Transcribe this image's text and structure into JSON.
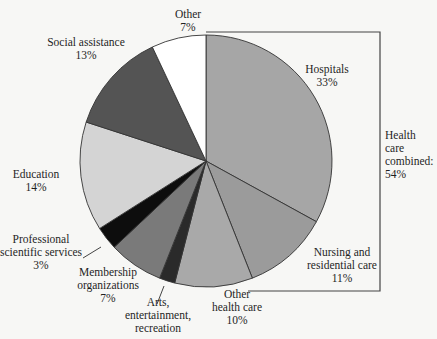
{
  "chart_data": {
    "type": "pie",
    "title": "",
    "start_angle_deg": 0,
    "direction": "clockwise",
    "slices": [
      {
        "label": "Hospitals",
        "value": 33,
        "value_label": "33%",
        "color": "#a6a6a6"
      },
      {
        "label": "Nursing and residential care",
        "value": 11,
        "value_label": "11%",
        "color": "#9b9b9b"
      },
      {
        "label": "Other health care",
        "value": 10,
        "value_label": "10%",
        "color": "#a9a9a9"
      },
      {
        "label": "Arts, entertainment, recreation",
        "value": 2,
        "value_label": "",
        "color": "#2a2a2a"
      },
      {
        "label": "Membership organizations",
        "value": 7,
        "value_label": "7%",
        "color": "#7a7a7a"
      },
      {
        "label": "Professional scientific services",
        "value": 3,
        "value_label": "3%",
        "color": "#0d0d0d"
      },
      {
        "label": "Education",
        "value": 14,
        "value_label": "14%",
        "color": "#d4d4d4"
      },
      {
        "label": "Social assistance",
        "value": 13,
        "value_label": "13%",
        "color": "#545454"
      },
      {
        "label": "Other",
        "value": 7,
        "value_label": "7%",
        "color": "#ffffff"
      }
    ],
    "annotations": [
      {
        "text": "Health care combined: 54%",
        "brackets": [
          "Hospitals",
          "Nursing and residential care",
          "Other health care"
        ]
      }
    ],
    "legend": "none"
  },
  "labels": {
    "hospitals": {
      "name": "Hospitals",
      "pct": "33%"
    },
    "nursing": {
      "line1": "Nursing and",
      "line2": "residential care",
      "pct": "11%"
    },
    "other_health": {
      "line1": "Other",
      "line2": "health care",
      "pct": "10%"
    },
    "arts": {
      "line1": "Arts,",
      "line2": "entertainment,",
      "line3": "recreation"
    },
    "membership": {
      "line1": "Membership",
      "line2": "organizations",
      "pct": "7%"
    },
    "professional": {
      "line1": "Professional",
      "line2": "scientific services",
      "pct": "3%"
    },
    "education": {
      "name": "Education",
      "pct": "14%"
    },
    "social": {
      "name": "Social assistance",
      "pct": "13%"
    },
    "other": {
      "name": "Other",
      "pct": "7%"
    },
    "health_combined": {
      "line1": "Health",
      "line2": "care",
      "line3": "combined:",
      "pct": "54%"
    }
  }
}
